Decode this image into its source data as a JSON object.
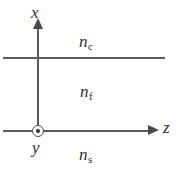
{
  "figure": {
    "line_color": "#5a5a5a",
    "text_color": "#2e2e2e",
    "background": "#ffffff"
  },
  "axes": {
    "x": {
      "label": "x",
      "direction": "up"
    },
    "z": {
      "label": "z",
      "direction": "right"
    },
    "y": {
      "label": "y",
      "direction": "out-of-page",
      "symbol": "circled-dot"
    }
  },
  "regions": {
    "cladding": {
      "symbol": "n",
      "subscript": "c"
    },
    "film": {
      "symbol": "n",
      "subscript": "f"
    },
    "substrate": {
      "symbol": "n",
      "subscript": "s"
    }
  }
}
